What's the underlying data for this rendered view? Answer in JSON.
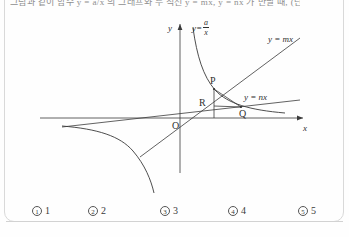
{
  "document": {
    "type": "math-multiple-choice-figure",
    "stem_fragment": "그림과 같이 함수 y = a/x 의 그래프와 두 직선 y = mx, y = nx 가 만날 때, (단, a > 0, m > n > 0)"
  },
  "figure": {
    "axes": {
      "y_label": "y",
      "x_label": "x",
      "origin_label": "O"
    },
    "curves": [
      {
        "name": "hyperbola",
        "label_lhs": "y",
        "label_eq": "=",
        "label_num": "a",
        "label_den": "x",
        "label_full": "y = a/x"
      },
      {
        "name": "line-m",
        "label": "y = mx"
      },
      {
        "name": "line-n",
        "label": "y = nx"
      }
    ],
    "points": [
      {
        "name": "P",
        "label": "P"
      },
      {
        "name": "R",
        "label": "R"
      },
      {
        "name": "Q",
        "label": "Q"
      }
    ],
    "colors": {
      "ink": "#2f2f2f",
      "paper": "#fefefe",
      "rule": "#d2d2d2"
    }
  },
  "choices": [
    {
      "marker": "1",
      "text": "1"
    },
    {
      "marker": "2",
      "text": "2"
    },
    {
      "marker": "3",
      "text": "3"
    },
    {
      "marker": "4",
      "text": "4"
    },
    {
      "marker": "5",
      "text": "5"
    }
  ]
}
